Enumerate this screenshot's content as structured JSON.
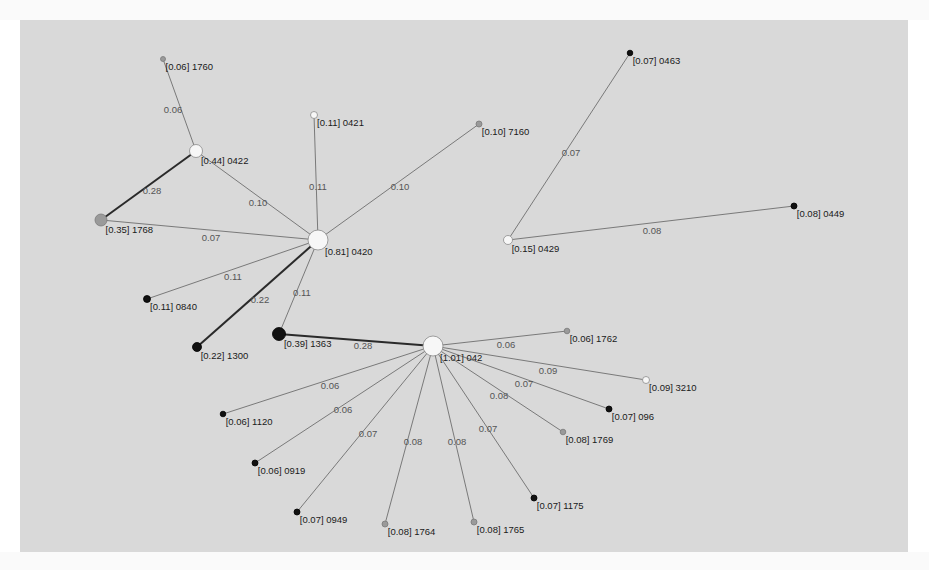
{
  "figure": {
    "background": "#d9d9d9",
    "panel": {
      "x": 20,
      "y": 20,
      "width": 888,
      "height": 532
    }
  },
  "legend_colors": {
    "white": "#f7f7f7",
    "gray": "#9a9a9a",
    "black": "#111111",
    "edge_thin": "#6e6e6e",
    "edge_thick": "#2a2a2a"
  },
  "nodes": [
    {
      "id": "0420",
      "weight": "0.81",
      "label": "[0.81] 0420",
      "x": 318,
      "y": 240,
      "r": 10,
      "fill": "white"
    },
    {
      "id": "042",
      "weight": "1.01",
      "label": "[1.01] 042",
      "x": 433,
      "y": 346,
      "r": 10,
      "fill": "white"
    },
    {
      "id": "0422",
      "weight": "0.44",
      "label": "[0.44] 0422",
      "x": 196,
      "y": 151,
      "r": 6.5,
      "fill": "white"
    },
    {
      "id": "1760",
      "weight": "0.06",
      "label": "[0.06] 1760",
      "x": 163,
      "y": 59,
      "r": 2.5,
      "fill": "gray"
    },
    {
      "id": "0421",
      "weight": "0.11",
      "label": "[0.11] 0421",
      "x": 314,
      "y": 115,
      "r": 3.5,
      "fill": "white"
    },
    {
      "id": "7160",
      "weight": "0.10",
      "label": "[0.10] 7160",
      "x": 479,
      "y": 124,
      "r": 3,
      "fill": "gray"
    },
    {
      "id": "1768",
      "weight": "0.35",
      "label": "[0.35] 1768",
      "x": 101,
      "y": 220,
      "r": 6,
      "fill": "gray"
    },
    {
      "id": "0840",
      "weight": "0.11",
      "label": "[0.11] 0840",
      "x": 147,
      "y": 299,
      "r": 3.5,
      "fill": "black"
    },
    {
      "id": "1300",
      "weight": "0.22",
      "label": "[0.22] 1300",
      "x": 197,
      "y": 347,
      "r": 4.5,
      "fill": "black"
    },
    {
      "id": "1363",
      "weight": "0.39",
      "label": "[0.39] 1363",
      "x": 279,
      "y": 334,
      "r": 6.5,
      "fill": "black"
    },
    {
      "id": "0429",
      "weight": "0.15",
      "label": "[0.15] 0429",
      "x": 508,
      "y": 240,
      "r": 4.5,
      "fill": "white"
    },
    {
      "id": "0463",
      "weight": "0.07",
      "label": "[0.07] 0463",
      "x": 630,
      "y": 53,
      "r": 2.8,
      "fill": "black"
    },
    {
      "id": "0449",
      "weight": "0.08",
      "label": "[0.08] 0449",
      "x": 794,
      "y": 206,
      "r": 3,
      "fill": "black"
    },
    {
      "id": "1762",
      "weight": "0.06",
      "label": "[0.06] 1762",
      "x": 567,
      "y": 331,
      "r": 2.8,
      "fill": "gray"
    },
    {
      "id": "3210",
      "weight": "0.09",
      "label": "[0.09] 3210",
      "x": 646,
      "y": 380,
      "r": 3.5,
      "fill": "white"
    },
    {
      "id": "096",
      "weight": "0.07",
      "label": "[0.07] 096",
      "x": 609,
      "y": 409,
      "r": 3,
      "fill": "black"
    },
    {
      "id": "1769",
      "weight": "0.08",
      "label": "[0.08] 1769",
      "x": 563,
      "y": 432,
      "r": 2.8,
      "fill": "gray"
    },
    {
      "id": "1175",
      "weight": "0.07",
      "label": "[0.07] 1175",
      "x": 534,
      "y": 498,
      "r": 3,
      "fill": "black"
    },
    {
      "id": "1765",
      "weight": "0.08",
      "label": "[0.08] 1765",
      "x": 474,
      "y": 522,
      "r": 3,
      "fill": "gray"
    },
    {
      "id": "1764",
      "weight": "0.08",
      "label": "[0.08] 1764",
      "x": 385,
      "y": 524,
      "r": 3,
      "fill": "gray"
    },
    {
      "id": "0949",
      "weight": "0.07",
      "label": "[0.07] 0949",
      "x": 297,
      "y": 512,
      "r": 3,
      "fill": "black"
    },
    {
      "id": "0919",
      "weight": "0.06",
      "label": "[0.06] 0919",
      "x": 255,
      "y": 463,
      "r": 3,
      "fill": "black"
    },
    {
      "id": "1120",
      "weight": "0.06",
      "label": "[0.06] 1120",
      "x": 223,
      "y": 414,
      "r": 2.8,
      "fill": "black"
    }
  ],
  "edges": [
    {
      "source": "0422",
      "target": "1760",
      "weight": "0.06",
      "lx": 173,
      "ly": 113
    },
    {
      "source": "0422",
      "target": "1768",
      "weight": "0.28",
      "lx": 152,
      "ly": 194,
      "thick": true
    },
    {
      "source": "0422",
      "target": "0420",
      "weight": "0.10",
      "lx": 258,
      "ly": 206
    },
    {
      "source": "0420",
      "target": "0421",
      "weight": "0.11",
      "lx": 318,
      "ly": 190
    },
    {
      "source": "0420",
      "target": "7160",
      "weight": "0.10",
      "lx": 400,
      "ly": 190
    },
    {
      "source": "0420",
      "target": "1768",
      "weight": "0.07",
      "lx": 211,
      "ly": 241
    },
    {
      "source": "0420",
      "target": "0840",
      "weight": "0.11",
      "lx": 233,
      "ly": 280
    },
    {
      "source": "0420",
      "target": "1300",
      "weight": "0.22",
      "lx": 260,
      "ly": 303,
      "thick": true
    },
    {
      "source": "0420",
      "target": "1363",
      "weight": "0.11",
      "lx": 302,
      "ly": 296
    },
    {
      "source": "0429",
      "target": "0463",
      "weight": "0.07",
      "lx": 571,
      "ly": 156
    },
    {
      "source": "0429",
      "target": "0449",
      "weight": "0.08",
      "lx": 652,
      "ly": 234
    },
    {
      "source": "042",
      "target": "1363",
      "weight": "0.28",
      "lx": 363,
      "ly": 349,
      "thick": true
    },
    {
      "source": "042",
      "target": "1762",
      "weight": "0.06",
      "lx": 506,
      "ly": 348
    },
    {
      "source": "042",
      "target": "3210",
      "weight": "0.09",
      "lx": 548,
      "ly": 374
    },
    {
      "source": "042",
      "target": "096",
      "weight": "0.07",
      "lx": 524,
      "ly": 387
    },
    {
      "source": "042",
      "target": "1769",
      "weight": "0.08",
      "lx": 499,
      "ly": 399
    },
    {
      "source": "042",
      "target": "1175",
      "weight": "0.07",
      "lx": 488,
      "ly": 432
    },
    {
      "source": "042",
      "target": "1765",
      "weight": "0.08",
      "lx": 457,
      "ly": 445
    },
    {
      "source": "042",
      "target": "1764",
      "weight": "0.08",
      "lx": 413,
      "ly": 445
    },
    {
      "source": "042",
      "target": "0949",
      "weight": "0.07",
      "lx": 368,
      "ly": 437
    },
    {
      "source": "042",
      "target": "0919",
      "weight": "0.06",
      "lx": 343,
      "ly": 413
    },
    {
      "source": "042",
      "target": "1120",
      "weight": "0.06",
      "lx": 330,
      "ly": 389
    }
  ]
}
